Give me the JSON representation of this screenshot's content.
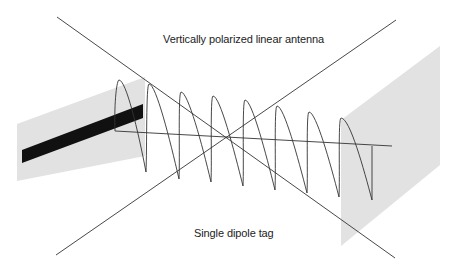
{
  "labels": {
    "antenna": "Vertically polarized linear antenna",
    "tag": "Single dipole tag"
  },
  "colors": {
    "background": "#ffffff",
    "panel": "#e2e2e2",
    "dipole": "#111111",
    "line": "#333333",
    "text": "#222222"
  },
  "elements": {
    "left_panel": "antenna-plane",
    "dipole_bar": "dipole-antenna",
    "right_panel": "tag-plane",
    "wave": "vertically-polarized-wave",
    "propagation_axis": "propagation-axis",
    "cross_lines": [
      "diagonal-line-1",
      "diagonal-line-2"
    ]
  }
}
